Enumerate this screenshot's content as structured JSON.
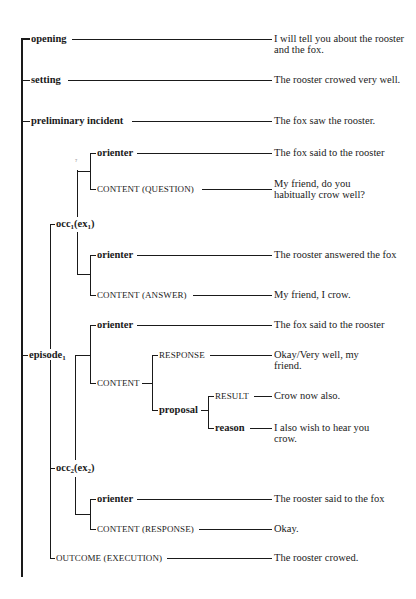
{
  "diagram": {
    "type": "tree",
    "title": "",
    "root_trunk": {
      "x": 22,
      "y1": 37,
      "y2": 577
    },
    "nodes": [
      {
        "id": "opening",
        "label": "opening",
        "style": "bold",
        "x": 30,
        "y": 39,
        "text": "I will tell you about the rooster and the fox.",
        "text_y": 35
      },
      {
        "id": "setting",
        "label": "setting",
        "style": "bold",
        "x": 30,
        "y": 80,
        "text": "The rooster crowed very well.",
        "text_y": 76
      },
      {
        "id": "preliminary-incident",
        "label": "preliminary incident",
        "style": "bold",
        "x": 30,
        "y": 121,
        "text": "The fox saw the rooster.",
        "text_y": 117
      },
      {
        "id": "occ1-orienter",
        "label": "orienter",
        "style": "bold",
        "x": 96,
        "y": 153,
        "text": "The fox said to the rooster",
        "text_y": 149
      },
      {
        "id": "occ1-content-question",
        "label": "CONTENT (QUESTION)",
        "style": "caps",
        "x": 96,
        "y": 189,
        "text": "My friend, do you habitually crow well?",
        "text_y": 179
      },
      {
        "id": "occ1",
        "label_main": "occ",
        "label_sub1": "1",
        "label_mid": "(ex",
        "label_sub2": "1",
        "label_end": ")",
        "style": "bold",
        "x": 55,
        "y": 224
      },
      {
        "id": "occ1-orienter-2",
        "label": "orienter",
        "style": "bold",
        "x": 96,
        "y": 255,
        "text": "The rooster answered the fox",
        "text_y": 251
      },
      {
        "id": "occ1-content-answer",
        "label": "CONTENT (ANSWER)",
        "style": "caps",
        "x": 96,
        "y": 295,
        "text": "My friend, I crow.",
        "text_y": 291
      },
      {
        "id": "episode1-orienter",
        "label": "orienter",
        "style": "bold",
        "x": 96,
        "y": 325,
        "text": "The fox said to the rooster",
        "text_y": 321
      },
      {
        "id": "episode1",
        "label_main": "episode",
        "label_sub1": "1",
        "style": "bold",
        "x": 26,
        "y": 355
      },
      {
        "id": "response",
        "label": "RESPONSE",
        "style": "caps",
        "x": 158,
        "y": 355,
        "text": "Okay/Very well, my friend.",
        "text_y": 351
      },
      {
        "id": "content",
        "label": "CONTENT",
        "style": "caps",
        "x": 96,
        "y": 383
      },
      {
        "id": "result",
        "label": "RESULT",
        "style": "caps",
        "x": 214,
        "y": 396,
        "text": "Crow now also.",
        "text_y": 392
      },
      {
        "id": "proposal",
        "label": "proposal",
        "style": "bold",
        "x": 158,
        "y": 410
      },
      {
        "id": "reason",
        "label": "reason",
        "style": "bold",
        "x": 214,
        "y": 428,
        "text": "I also wish to hear you crow.",
        "text_y": 424
      },
      {
        "id": "occ2",
        "label_main": "occ",
        "label_sub1": "2",
        "label_mid": "(ex",
        "label_sub2": "2",
        "label_end": ")",
        "style": "bold",
        "x": 55,
        "y": 468
      },
      {
        "id": "occ2-orienter",
        "label": "orienter",
        "style": "bold",
        "x": 96,
        "y": 499,
        "text": "The rooster said to the fox",
        "text_y": 495
      },
      {
        "id": "occ2-content-response",
        "label": "CONTENT (RESPONSE)",
        "style": "caps",
        "x": 96,
        "y": 529,
        "text": "Okay.",
        "text_y": 525
      },
      {
        "id": "outcome-execution",
        "label": "OUTCOME (EXECUTION)",
        "style": "caps",
        "x": 55,
        "y": 558,
        "text": "The rooster crowed.",
        "text_y": 554
      }
    ],
    "tick_mark": "?"
  }
}
